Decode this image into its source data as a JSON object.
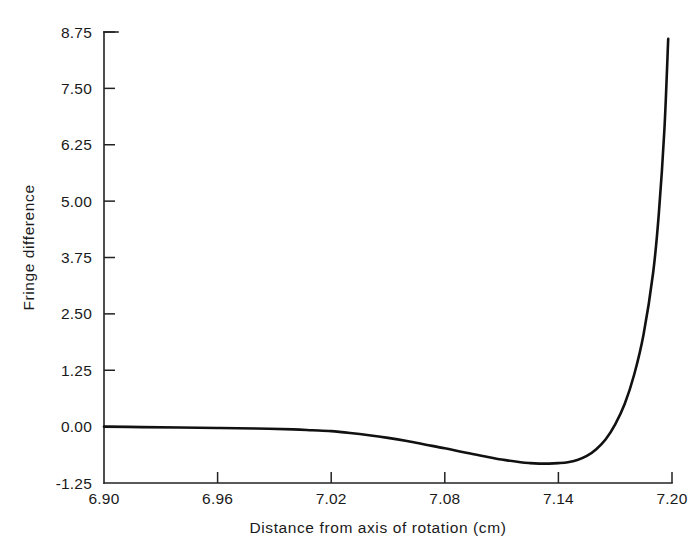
{
  "chart_data": {
    "type": "line",
    "title": "",
    "xlabel": "Distance from axis of rotation (cm)",
    "ylabel": "Fringe difference",
    "xlim": [
      6.9,
      7.2
    ],
    "ylim": [
      -1.25,
      8.75
    ],
    "grid": false,
    "legend": false,
    "xticks": [
      6.9,
      7.02,
      7.02,
      7.08,
      7.14,
      7.2
    ],
    "xtick_labels": [
      "6.90",
      "6.96",
      "7.02",
      "7.08",
      "7.14",
      "7.20"
    ],
    "xtick_values": [
      6.9,
      6.96,
      7.02,
      7.08,
      7.14,
      7.2
    ],
    "ytick_labels": [
      "8.75",
      "7.50",
      "6.25",
      "5.00",
      "3.75",
      "2.50",
      "1.25",
      "0.00",
      "-1.25"
    ],
    "ytick_values": [
      8.75,
      7.5,
      6.25,
      5.0,
      3.75,
      2.5,
      1.25,
      0.0,
      -1.25
    ],
    "series": [
      {
        "name": "Fringe difference",
        "color": "#111111",
        "x": [
          6.9,
          6.92,
          6.94,
          6.96,
          6.98,
          7.0,
          7.01,
          7.02,
          7.03,
          7.04,
          7.05,
          7.06,
          7.07,
          7.08,
          7.09,
          7.1,
          7.11,
          7.12,
          7.125,
          7.13,
          7.135,
          7.14,
          7.145,
          7.15,
          7.155,
          7.16,
          7.165,
          7.17,
          7.175,
          7.18,
          7.185,
          7.19,
          7.193,
          7.196,
          7.198
        ],
        "y": [
          0.0,
          -0.01,
          -0.02,
          -0.03,
          -0.04,
          -0.06,
          -0.08,
          -0.1,
          -0.14,
          -0.19,
          -0.25,
          -0.32,
          -0.4,
          -0.48,
          -0.57,
          -0.65,
          -0.73,
          -0.79,
          -0.81,
          -0.82,
          -0.82,
          -0.81,
          -0.79,
          -0.74,
          -0.65,
          -0.5,
          -0.28,
          0.05,
          0.5,
          1.15,
          2.05,
          3.4,
          4.7,
          6.6,
          8.6
        ]
      }
    ]
  },
  "axes": {
    "spine_color": "#222222",
    "background": "#ffffff"
  }
}
